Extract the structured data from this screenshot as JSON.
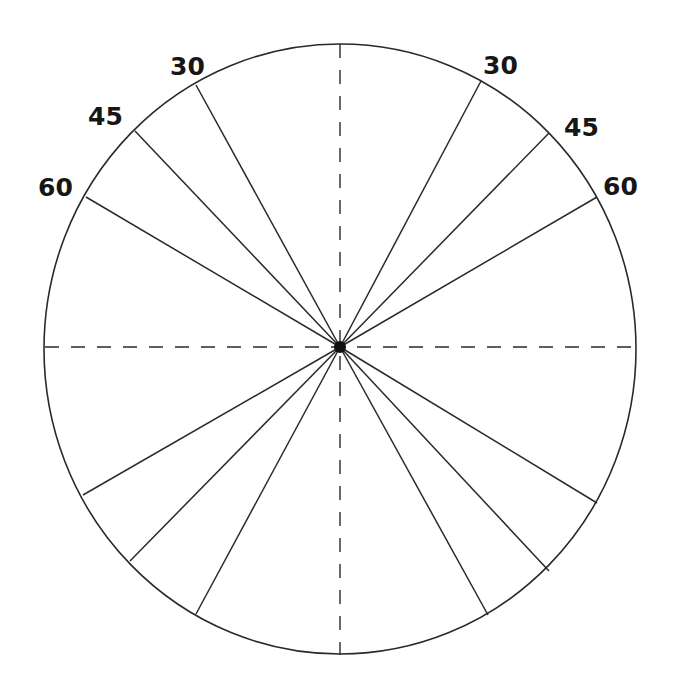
{
  "diagram": {
    "type": "protractor-wheel",
    "center": {
      "x": 340,
      "y": 347
    },
    "radius_x": 296,
    "radius_y": 305,
    "stroke_color": "#2a2a2a",
    "center_dot_color": "#111111",
    "labels": {
      "upper_left": [
        {
          "text": "30",
          "x": 190,
          "y": 74
        },
        {
          "text": "45",
          "x": 108,
          "y": 126
        },
        {
          "text": "60",
          "x": 58,
          "y": 197
        }
      ],
      "upper_right": [
        {
          "text": "30",
          "x": 505,
          "y": 73
        },
        {
          "text": "45",
          "x": 585,
          "y": 135
        },
        {
          "text": "60",
          "x": 623,
          "y": 194
        }
      ]
    },
    "spokes": [
      {
        "name": "spoke-upper-left-30",
        "x2": 196,
        "y2": 85
      },
      {
        "name": "spoke-upper-left-45",
        "x2": 135,
        "y2": 131
      },
      {
        "name": "spoke-upper-left-60",
        "x2": 86,
        "y2": 197
      },
      {
        "name": "spoke-upper-right-30",
        "x2": 481,
        "y2": 81
      },
      {
        "name": "spoke-upper-right-45",
        "x2": 549,
        "y2": 133
      },
      {
        "name": "spoke-upper-right-60",
        "x2": 597,
        "y2": 197
      },
      {
        "name": "spoke-lower-left-60",
        "x2": 83,
        "y2": 495
      },
      {
        "name": "spoke-lower-left-45",
        "x2": 130,
        "y2": 561
      },
      {
        "name": "spoke-lower-left-30",
        "x2": 196,
        "y2": 614
      },
      {
        "name": "spoke-lower-right-60",
        "x2": 597,
        "y2": 503
      },
      {
        "name": "spoke-lower-right-45",
        "x2": 549,
        "y2": 571
      },
      {
        "name": "spoke-lower-right-30",
        "x2": 488,
        "y2": 615
      }
    ],
    "axes": {
      "horizontal": {
        "x1": 45,
        "y1": 347,
        "x2": 636,
        "y2": 347,
        "style": "dashed"
      },
      "vertical": {
        "x1": 340,
        "y1": 44,
        "x2": 340,
        "y2": 655,
        "style": "dashed"
      }
    }
  }
}
